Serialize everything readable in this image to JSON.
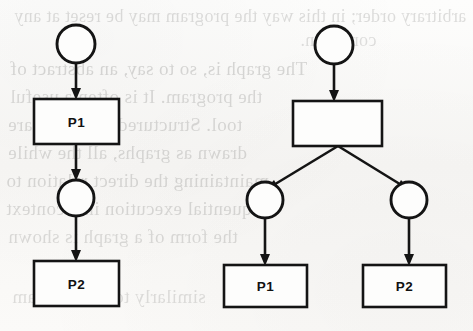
{
  "figure": {
    "kind": "scanned-book-figure",
    "ink_color": "#141414",
    "paper_color": "#fbfbfa",
    "ghost_text_color": "#3a3a38"
  },
  "diagrams": [
    {
      "id": "left-diagram",
      "name": "sequential-graph",
      "nodes": [
        {
          "id": "l-c1",
          "type": "circle",
          "label": "",
          "cx": 76,
          "cy": 44,
          "r": 19
        },
        {
          "id": "l-b1",
          "type": "rect",
          "label": "P1",
          "x": 34,
          "y": 99,
          "w": 85,
          "h": 45
        },
        {
          "id": "l-c2",
          "type": "circle",
          "label": "",
          "cx": 76,
          "cy": 198,
          "r": 18
        },
        {
          "id": "l-b2",
          "type": "rect",
          "label": "P2",
          "x": 34,
          "y": 261,
          "w": 85,
          "h": 45
        }
      ],
      "edges": [
        {
          "id": "l-e1",
          "from": "l-c1",
          "to": "l-b1"
        },
        {
          "id": "l-e2",
          "from": "l-b1",
          "to": "l-c2"
        },
        {
          "id": "l-e3",
          "from": "l-c2",
          "to": "l-b2"
        }
      ]
    },
    {
      "id": "right-diagram",
      "name": "forking-graph",
      "nodes": [
        {
          "id": "r-c1",
          "type": "circle",
          "label": "",
          "cx": 334,
          "cy": 45,
          "r": 19
        },
        {
          "id": "r-b0",
          "type": "rect",
          "label": "",
          "x": 293,
          "y": 101,
          "w": 89,
          "h": 45
        },
        {
          "id": "r-c2",
          "type": "circle",
          "label": "",
          "cx": 265,
          "cy": 200,
          "r": 18
        },
        {
          "id": "r-c3",
          "type": "circle",
          "label": "",
          "cx": 409,
          "cy": 200,
          "r": 18
        },
        {
          "id": "r-b1",
          "type": "rect",
          "label": "P1",
          "x": 224,
          "y": 265,
          "w": 83,
          "h": 42
        },
        {
          "id": "r-b2",
          "type": "rect",
          "label": "P2",
          "x": 363,
          "y": 265,
          "w": 83,
          "h": 42
        }
      ],
      "edges": [
        {
          "id": "r-e1",
          "from": "r-c1",
          "to": "r-b0"
        },
        {
          "id": "r-e2",
          "from": "r-b0",
          "to": "r-c2"
        },
        {
          "id": "r-e3",
          "from": "r-b0",
          "to": "r-c3"
        },
        {
          "id": "r-e4",
          "from": "r-c2",
          "to": "r-b1"
        },
        {
          "id": "r-e5",
          "from": "r-c3",
          "to": "r-b2"
        }
      ]
    }
  ],
  "labels": {
    "left_process_1": "P1",
    "left_process_2": "P2",
    "right_process_1": "P1",
    "right_process_2": "P2"
  },
  "ghost_text": {
    "note": "Faint mirrored show-through of printed text from the reverse side of the page",
    "lines": [
      {
        "text": "arbitrary order; in this way the program may be reset at any",
        "x": 14,
        "y": 6,
        "size": 18,
        "opacity": 0.16
      },
      {
        "text": "condition.",
        "x": 300,
        "y": 30,
        "size": 18,
        "opacity": 0.15
      },
      {
        "text": "The graph is, so to say, an abstract of",
        "x": 10,
        "y": 58,
        "size": 19,
        "opacity": 0.18
      },
      {
        "text": "the program. It is often a useful",
        "x": 10,
        "y": 86,
        "size": 19,
        "opacity": 0.17
      },
      {
        "text": "tool. Structured programs are",
        "x": 8,
        "y": 114,
        "size": 19,
        "opacity": 0.17
      },
      {
        "text": "drawn as graphs, all the while",
        "x": 8,
        "y": 142,
        "size": 19,
        "opacity": 0.17
      },
      {
        "text": "maintaining the direct relation to",
        "x": 6,
        "y": 170,
        "size": 19,
        "opacity": 0.17
      },
      {
        "text": "sequential execution in a context",
        "x": 6,
        "y": 198,
        "size": 19,
        "opacity": 0.17
      },
      {
        "text": "the form of a graph is shown",
        "x": 8,
        "y": 226,
        "size": 19,
        "opacity": 0.16
      },
      {
        "text": "similarly to the program",
        "x": 12,
        "y": 286,
        "size": 19,
        "opacity": 0.15
      }
    ]
  }
}
